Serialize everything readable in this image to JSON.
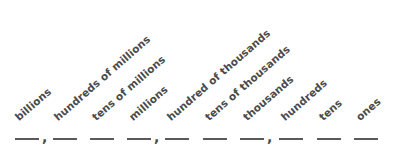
{
  "document": {
    "type": "place-value-chart",
    "title": "Place Value Chart Blanks",
    "text_color": "#4a4a4a",
    "line_color": "#5a5a5a",
    "background_color": "#ffffff",
    "label_rotation_deg": -41
  },
  "places": [
    {
      "label": "billions",
      "label_x": 20,
      "label_y": 122,
      "blank_x": 15,
      "blank_width": 24,
      "blank_y": 138,
      "comma_after": true,
      "comma_x": 42,
      "comma_y": 130
    },
    {
      "label": "hundreds of millions",
      "label_x": 59,
      "label_y": 122,
      "blank_x": 53,
      "blank_width": 24,
      "blank_y": 138,
      "comma_after": false,
      "comma_x": 0,
      "comma_y": 0
    },
    {
      "label": "tens of millions",
      "label_x": 97,
      "label_y": 122,
      "blank_x": 90,
      "blank_width": 24,
      "blank_y": 138,
      "comma_after": false,
      "comma_x": 0,
      "comma_y": 0
    },
    {
      "label": "millions",
      "label_x": 134,
      "label_y": 122,
      "blank_x": 127,
      "blank_width": 24,
      "blank_y": 138,
      "comma_after": true,
      "comma_x": 154,
      "comma_y": 130
    },
    {
      "label": "hundred of thousands",
      "label_x": 172,
      "label_y": 122,
      "blank_x": 165,
      "blank_width": 24,
      "blank_y": 138,
      "comma_after": false,
      "comma_x": 0,
      "comma_y": 0
    },
    {
      "label": "tens of thousands",
      "label_x": 210,
      "label_y": 122,
      "blank_x": 203,
      "blank_width": 24,
      "blank_y": 138,
      "comma_after": false,
      "comma_x": 0,
      "comma_y": 0
    },
    {
      "label": "thousands",
      "label_x": 248,
      "label_y": 122,
      "blank_x": 240,
      "blank_width": 24,
      "blank_y": 138,
      "comma_after": true,
      "comma_x": 267,
      "comma_y": 130
    },
    {
      "label": "hundreds",
      "label_x": 286,
      "label_y": 122,
      "blank_x": 279,
      "blank_width": 24,
      "blank_y": 138,
      "comma_after": false,
      "comma_x": 0,
      "comma_y": 0
    },
    {
      "label": "tens",
      "label_x": 324,
      "label_y": 122,
      "blank_x": 317,
      "blank_width": 24,
      "blank_y": 138,
      "comma_after": false,
      "comma_x": 0,
      "comma_y": 0
    },
    {
      "label": "ones",
      "label_x": 361,
      "label_y": 122,
      "blank_x": 354,
      "blank_width": 24,
      "blank_y": 138,
      "comma_after": false,
      "comma_x": 0,
      "comma_y": 0
    }
  ],
  "separators": {
    "comma_glyph": ","
  }
}
